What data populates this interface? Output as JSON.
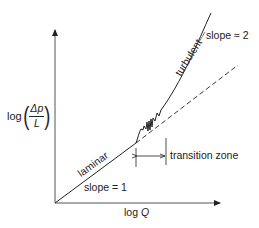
{
  "diagram": {
    "title": "",
    "axes": {
      "x_label": "log",
      "x_label_var": "Q",
      "y_label_prefix": "log",
      "y_label_numerator": "Δp",
      "y_label_denominator": "L"
    },
    "regions": {
      "laminar_label": "laminar",
      "laminar_slope": "slope = 1",
      "turbulent_label": "turbulent",
      "turbulent_slope": "slope ≈ 2",
      "transition_label": "transition zone"
    },
    "colors": {
      "line": "#222222",
      "axis": "#555555",
      "background": "#ffffff"
    }
  }
}
